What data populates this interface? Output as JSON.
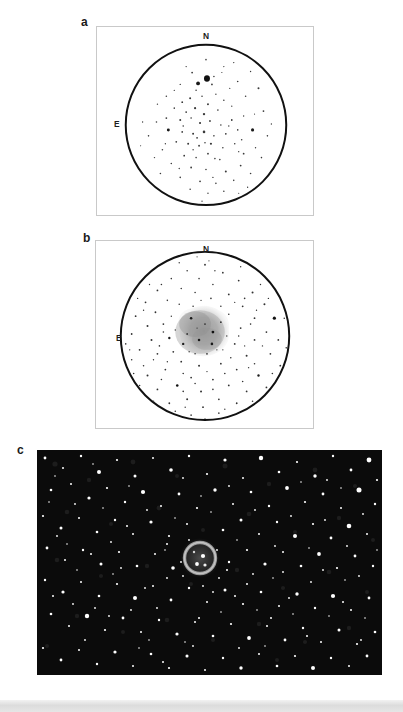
{
  "figure": {
    "background_color": "#ffffff",
    "width": 403,
    "height": 712
  },
  "panels": [
    {
      "id": "a",
      "label": "a",
      "type": "eyepiece-sketch",
      "description": "Visual eyepiece sketch: open star field inside a circular field-of-view, no nebula visible",
      "frame": {
        "x": 96,
        "y": 26,
        "width": 218,
        "height": 190
      },
      "frame_color": "#c9c9c9",
      "field_circle": {
        "cx": 110,
        "cy": 99,
        "r": 81,
        "stroke": "#111111",
        "stroke_width": 2
      },
      "compass": {
        "north_label": "N",
        "east_label": "E"
      },
      "star_count": 96,
      "nebula_visible": false,
      "ink_color": "#2b2b2b"
    },
    {
      "id": "b",
      "label": "b",
      "type": "eyepiece-sketch",
      "description": "Visual eyepiece sketch: denser star field with a diffuse grey irregular nebula near the centre",
      "frame": {
        "x": 95,
        "y": 240,
        "width": 219,
        "height": 189
      },
      "frame_color": "#c9c9c9",
      "field_circle": {
        "cx": 110,
        "cy": 96,
        "r": 85,
        "stroke": "#111111",
        "stroke_width": 2
      },
      "compass": {
        "north_label": "N",
        "east_label": "E"
      },
      "star_count": 158,
      "nebula_visible": true,
      "nebula": {
        "cx": 105,
        "cy": 94,
        "rx": 26,
        "ry": 23,
        "fill": "#9a9a9a",
        "shape": "irregular-blob"
      },
      "ink_color": "#2b2b2b"
    },
    {
      "id": "c",
      "label": "c",
      "type": "photographic-image",
      "description": "Deep photographic exposure of the same field: dense white stars on a dark sky with a resolved ring-shaped planetary nebula at centre",
      "frame": {
        "x": 37,
        "y": 450,
        "width": 345,
        "height": 225
      },
      "background_color": "#0a0a0a",
      "star_color": "#ffffff",
      "star_count": 520,
      "nebula_visible": true,
      "nebula": {
        "cx": 163,
        "cy": 108,
        "r_outer": 19,
        "r_inner": 12,
        "shape": "ring",
        "color": "#b8b8b8"
      }
    }
  ],
  "compass_labels": {
    "north": "N",
    "east": "E"
  },
  "colors": {
    "page_background": "#ffffff",
    "panel_border": "#c9c9c9",
    "ink": "#1a1a1a",
    "photo_background": "#0a0a0a",
    "star_white": "#ffffff",
    "nebula_grey": "#9a9a9a",
    "bottom_band": "#dcdcdc"
  },
  "bottom_band": {
    "present": true,
    "y": 700,
    "height": 12
  }
}
